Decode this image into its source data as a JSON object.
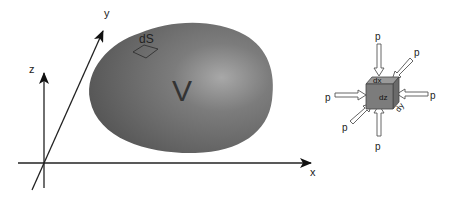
{
  "diagram": {
    "axes": {
      "x_label": "x",
      "y_label": "y",
      "z_label": "z"
    },
    "volume": {
      "label": "V",
      "surface_element_label": "dS",
      "fill_color": "#6e6e6e",
      "highlight_color": "#a4a4a4"
    },
    "element": {
      "dx_label": "dx",
      "dy_label": "dy",
      "dz_label": "dz",
      "face_color": "#7a7a7a"
    },
    "pressure_arrows": [
      {
        "label": "p",
        "direction": "top"
      },
      {
        "label": "p",
        "direction": "top-right"
      },
      {
        "label": "p",
        "direction": "left"
      },
      {
        "label": "p",
        "direction": "right"
      },
      {
        "label": "p",
        "direction": "bottom-left"
      },
      {
        "label": "p",
        "direction": "bottom"
      }
    ]
  }
}
